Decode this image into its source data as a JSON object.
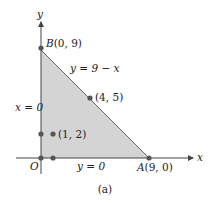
{
  "figure": {
    "caption": "(a)",
    "axes": {
      "x_label": "x",
      "y_label": "y",
      "origin_label": "O"
    },
    "region": {
      "fill": "#d4d4d4",
      "edge": "#666666",
      "vertices": [
        [
          0,
          0
        ],
        [
          9,
          0
        ],
        [
          0,
          9
        ]
      ]
    },
    "lines": [
      {
        "label": "y = 9 − x",
        "from": [
          0,
          9
        ],
        "to": [
          9,
          0
        ]
      },
      {
        "label": "x = 0",
        "from": [
          0,
          0
        ],
        "to": [
          0,
          9
        ]
      },
      {
        "label": "y = 0",
        "from": [
          0,
          0
        ],
        "to": [
          9,
          0
        ]
      }
    ],
    "points": [
      {
        "name": "B",
        "label": "B(0, 9)",
        "x": 0,
        "y": 9
      },
      {
        "name": "A",
        "label": "A(9, 0)",
        "x": 9,
        "y": 0
      },
      {
        "name": "P1",
        "label": "(4, 5)",
        "x": 4,
        "y": 5
      },
      {
        "name": "P2",
        "label": "(1, 2)",
        "x": 1,
        "y": 2
      },
      {
        "name": "O",
        "label": "O",
        "x": 0,
        "y": 0
      }
    ],
    "colors": {
      "axis": "#444444",
      "point": "#555555",
      "text": "#222222"
    }
  }
}
